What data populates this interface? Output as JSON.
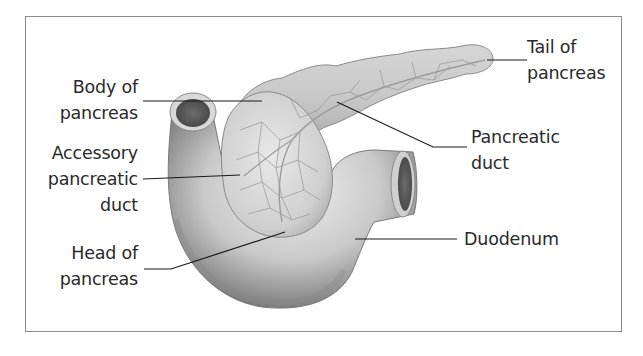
{
  "diagram": {
    "colors": {
      "frame": "#8a8a8a",
      "leader_line": "#1a1a1a",
      "text": "#2a2a2a",
      "tissue_light": "#e4e4e4",
      "tissue_mid": "#b8b8b8",
      "tissue_dark": "#6e6e6e",
      "lumen": "#5a5a5a"
    },
    "labels": [
      {
        "id": "body",
        "lines": [
          "Body of",
          "pancreas"
        ],
        "side": "left"
      },
      {
        "id": "accessory-duct",
        "lines": [
          "Accessory",
          "pancreatic",
          "duct"
        ],
        "side": "left"
      },
      {
        "id": "head",
        "lines": [
          "Head of",
          "pancreas"
        ],
        "side": "left"
      },
      {
        "id": "tail",
        "lines": [
          "Tail of",
          "pancreas"
        ],
        "side": "right"
      },
      {
        "id": "pancreatic-duct",
        "lines": [
          "Pancreatic",
          "duct"
        ],
        "side": "right"
      },
      {
        "id": "duodenum",
        "lines": [
          "Duodenum"
        ],
        "side": "right"
      }
    ],
    "structures": [
      "pancreas",
      "duodenum"
    ]
  }
}
